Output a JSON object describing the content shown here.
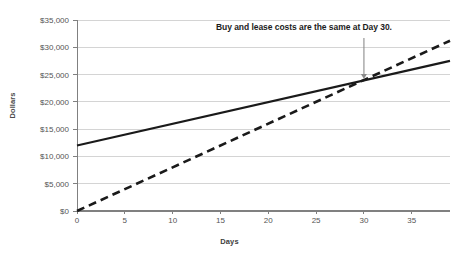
{
  "chart_data": {
    "type": "line",
    "title": "",
    "xlabel": "Days",
    "ylabel": "Dollars",
    "xlim": [
      0,
      39
    ],
    "ylim": [
      0,
      35000
    ],
    "grid": true,
    "legend": "none",
    "x_ticks": [
      0,
      5,
      10,
      15,
      20,
      25,
      30,
      35
    ],
    "x_tick_labels": [
      "0",
      "5",
      "10",
      "15",
      "20",
      "25",
      "30",
      "35"
    ],
    "y_ticks": [
      0,
      5000,
      10000,
      15000,
      20000,
      25000,
      30000,
      35000
    ],
    "y_tick_labels": [
      "$0",
      "$5,000",
      "$10,000",
      "$15,000",
      "$20,000",
      "$25,000",
      "$30,000",
      "$35,000"
    ],
    "series": [
      {
        "name": "Buy",
        "style": "solid",
        "color": "#1a1a1a",
        "x": [
          0,
          39
        ],
        "values": [
          12000,
          27500
        ]
      },
      {
        "name": "Lease",
        "style": "dashed",
        "color": "#1a1a1a",
        "x": [
          0,
          39
        ],
        "values": [
          0,
          31200
        ]
      }
    ],
    "annotations": [
      {
        "text": "Buy and lease costs are the same at Day 30.",
        "point_x": 30,
        "point_y": 23800,
        "arrow": true,
        "arrow_color": "#8c8c8c"
      }
    ],
    "colors": {
      "gridline": "#d4d4d4",
      "axis": "#808080",
      "tick_text": "#555555",
      "series_line": "#1a1a1a",
      "annotation_text": "#1c1c1c",
      "arrow": "#8c8c8c",
      "background": "#ffffff"
    }
  }
}
